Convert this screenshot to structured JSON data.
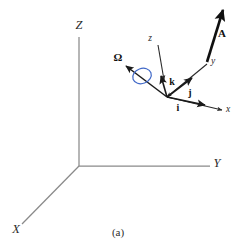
{
  "figure": {
    "caption": "(a)",
    "colors": {
      "axis_gray": "#8a8a8a",
      "vector_black": "#1a1a1a",
      "spin_blue": "#4169c8",
      "text_black": "#222222",
      "background": "#ffffff"
    },
    "global_axes": {
      "origin": {
        "x": 79,
        "y": 166
      },
      "labels": [
        {
          "name": "Z",
          "text": "Z",
          "x": 79,
          "y": 25
        },
        {
          "name": "Y",
          "text": "Y",
          "x": 217,
          "y": 163
        },
        {
          "name": "X",
          "text": "X",
          "x": 16,
          "y": 229
        }
      ]
    },
    "local_axes": {
      "origin": {
        "x": 167,
        "y": 97
      },
      "labels": [
        {
          "name": "z",
          "text": "z",
          "x": 150,
          "y": 39
        },
        {
          "name": "y",
          "text": "y",
          "x": 213,
          "y": 62
        },
        {
          "name": "x",
          "text": "x",
          "x": 228,
          "y": 110
        }
      ]
    },
    "unit_vectors": [
      {
        "name": "k",
        "text": "k",
        "x": 172,
        "y": 82
      },
      {
        "name": "j",
        "text": "j",
        "x": 190,
        "y": 93
      },
      {
        "name": "i",
        "text": "i",
        "x": 178,
        "y": 108
      }
    ],
    "vectors": [
      {
        "name": "A",
        "text": "A",
        "x": 222,
        "y": 33
      },
      {
        "name": "Omega",
        "text": "Ω",
        "x": 118,
        "y": 57
      }
    ],
    "spin_circle": {
      "cx": 142,
      "cy": 76,
      "rx": 9.5,
      "ry": 7.5,
      "rotation": -20
    }
  }
}
